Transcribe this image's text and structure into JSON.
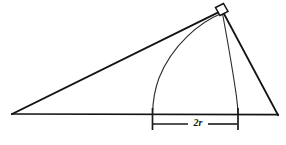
{
  "figure": {
    "type": "geometry-diagram",
    "background_color": "#ffffff",
    "line_color": "#141414",
    "arc_color": "#2a2a2a",
    "canvas": {
      "width": 286,
      "height": 145
    },
    "labels": {
      "dimension": "2r"
    },
    "vertices": {
      "left": {
        "x": 12,
        "y": 114
      },
      "right": {
        "x": 278,
        "y": 115
      },
      "apex": {
        "x": 222,
        "y": 10
      }
    },
    "right_angle_marker": {
      "present": true,
      "at_vertex": "apex",
      "size": 11
    },
    "arc": {
      "left_foot": {
        "x": 152,
        "y": 114
      },
      "right_foot": {
        "x": 238,
        "y": 114
      },
      "top": {
        "x": 220,
        "y": 14
      }
    },
    "dimension_line": {
      "y": 124,
      "x_start": 152,
      "x_end": 238,
      "tick_top": 108,
      "tick_bottom": 130,
      "label": "2r"
    }
  }
}
